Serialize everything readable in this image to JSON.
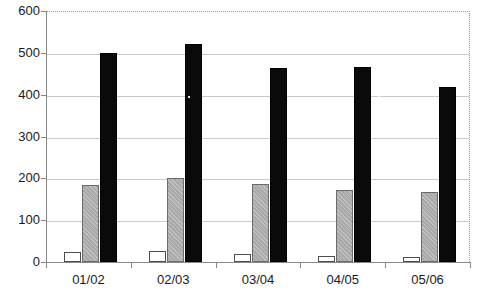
{
  "chart_data": {
    "type": "bar",
    "title": "",
    "subtitle": "",
    "xlabel": "",
    "ylabel": "",
    "categories": [
      "01/02",
      "02/03",
      "03/04",
      "04/05",
      "05/06"
    ],
    "series": [
      {
        "name": "series-1",
        "fill": "white",
        "values": [
          25,
          27,
          20,
          15,
          13
        ]
      },
      {
        "name": "series-2",
        "fill": "gray",
        "values": [
          185,
          201,
          187,
          172,
          167
        ]
      },
      {
        "name": "series-3",
        "fill": "black",
        "values": [
          500,
          521,
          463,
          467,
          418
        ]
      }
    ],
    "ylim": [
      0,
      600
    ],
    "ytick_values": [
      0,
      100,
      200,
      300,
      400,
      500,
      600
    ],
    "ytick_labels": [
      "0",
      "100",
      "200",
      "300",
      "400",
      "500",
      "600"
    ],
    "grid": true,
    "grid_axis": "y",
    "legend": null,
    "legend_position": "none",
    "annotations": [],
    "colors": {
      "series_1": "#ffffff",
      "series_2": "#a8a8a8",
      "series_3": "#0a0a0a",
      "gridline": "#c9c9c9",
      "axis": "#888888",
      "text": "#1a1a1a"
    }
  }
}
